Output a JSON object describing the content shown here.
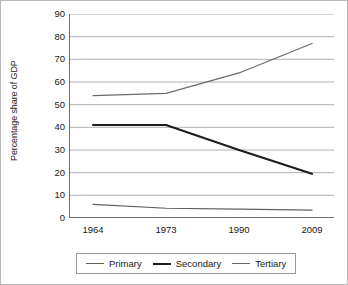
{
  "chart_data": {
    "type": "line",
    "title": "",
    "xlabel": "",
    "ylabel": "Percentage share of GDP",
    "categories": [
      "1964",
      "1973",
      "1990",
      "2009"
    ],
    "ylim": [
      0,
      90
    ],
    "yticks": [
      0,
      10,
      20,
      30,
      40,
      50,
      60,
      70,
      80,
      90
    ],
    "grid": "horizontal",
    "legend_position": "bottom",
    "series": [
      {
        "name": "Primary",
        "color": "#5f5f5f",
        "line_width": 1.2,
        "values": [
          6,
          4.3,
          3.9,
          3.5
        ]
      },
      {
        "name": "Secondary",
        "color": "#1c1c1c",
        "line_width": 2.1,
        "values": [
          41,
          41,
          30,
          19.5
        ]
      },
      {
        "name": "Tertiary",
        "color": "#6a6a6a",
        "line_width": 1.2,
        "values": [
          54,
          55,
          64,
          77
        ]
      }
    ]
  },
  "style": {
    "grid_color": "#9c9c9c",
    "axis_color": "#6e6e6e",
    "border_color": "#b9b9b9",
    "background": "#ffffff",
    "text_color": "#1a1a1a"
  }
}
